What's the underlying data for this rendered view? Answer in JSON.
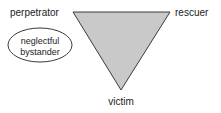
{
  "diagram": {
    "colors": {
      "triangle_fill": "#c9c9c9",
      "triangle_stroke": "#3a3a3a",
      "ellipse_fill": "#ffffff",
      "ellipse_stroke": "#3a3a3a",
      "text": "#1a1a1a",
      "background": "#ffffff"
    },
    "triangle": {
      "shape": "inverted-triangle",
      "vertices": [
        {
          "id": "perpetrator",
          "x": 73,
          "y": 12
        },
        {
          "id": "rescuer",
          "x": 170,
          "y": 12
        },
        {
          "id": "victim",
          "x": 121,
          "y": 90
        }
      ]
    },
    "labels": {
      "perpetrator": "perpetrator",
      "rescuer": "rescuer",
      "victim": "victim"
    },
    "bystander": {
      "line1": "neglectful",
      "line2": "bystander",
      "shape": "ellipse",
      "cx": 40,
      "cy": 45,
      "rx": 32,
      "ry": 17
    }
  }
}
